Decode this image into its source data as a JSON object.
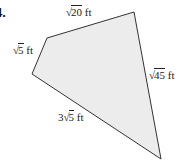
{
  "problem": {
    "number": "4."
  },
  "figure": {
    "shape": "quadrilateral",
    "fill_color": "#ececec",
    "stroke_color": "#333333",
    "vertices": [
      {
        "x": 47,
        "y": 38
      },
      {
        "x": 134,
        "y": 12
      },
      {
        "x": 161,
        "y": 159
      },
      {
        "x": 32,
        "y": 74
      }
    ],
    "sides": [
      {
        "id": "top",
        "coefficient": "",
        "radical": "√",
        "radicand": "20",
        "unit": "ft"
      },
      {
        "id": "left",
        "coefficient": "",
        "radical": "√",
        "radicand": "5",
        "unit": "ft"
      },
      {
        "id": "right",
        "coefficient": "",
        "radical": "√",
        "radicand": "45",
        "unit": "ft"
      },
      {
        "id": "bottom",
        "coefficient": "3",
        "radical": "√",
        "radicand": "5",
        "unit": "ft"
      }
    ]
  }
}
